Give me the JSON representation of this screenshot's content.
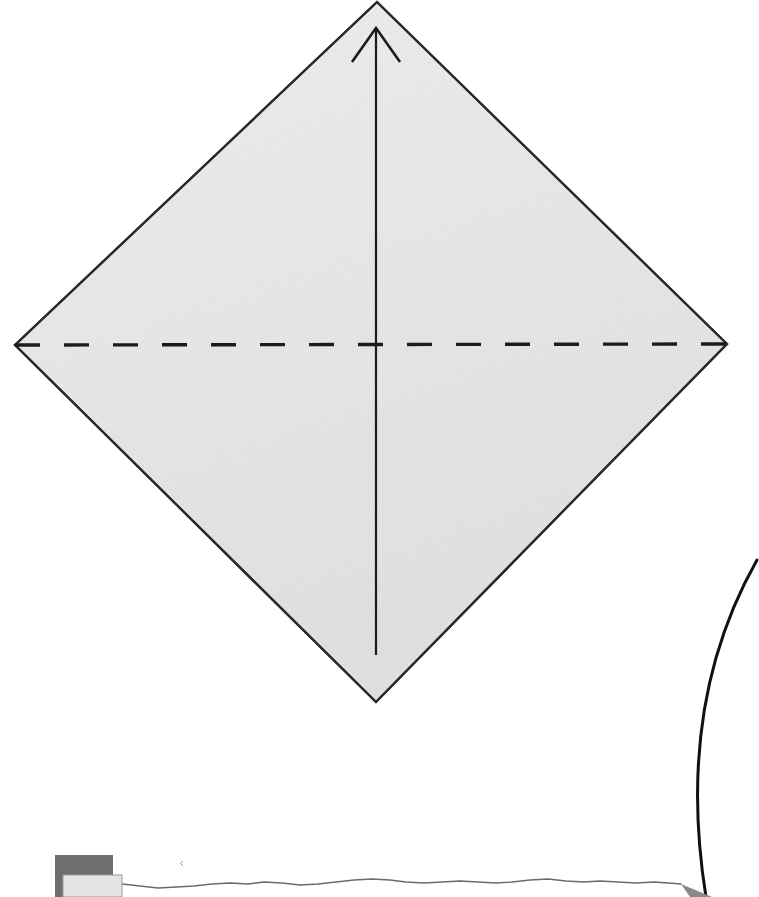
{
  "figure": {
    "kind": "origami-fold-diagram",
    "title": "Origami kite base valley-fold step",
    "background_color": "#ffffff",
    "canvas": {
      "width": 759,
      "height": 897
    }
  },
  "colors": {
    "paper_fill": "#e8e8e8",
    "paper_fill_light": "#efefef",
    "paper_outline": "#2a2a2a",
    "fold_line": "#1c1c1c",
    "arrow_line": "#1c1c1c",
    "curve_line": "#111111",
    "swatch_dark": "#6f6e6e",
    "swatch_light": "#e4e4e4",
    "swatch_outline": "#9a9a9a",
    "wavy_line": "#6a6a6a",
    "wedge_fill": "#8a8a8a"
  },
  "shapes": {
    "paper_sheet": {
      "name": "square sheet rotated 45 degrees (diamond)",
      "vertices": [
        {
          "label": "top",
          "x": 377,
          "y": 2
        },
        {
          "label": "right",
          "x": 727,
          "y": 344
        },
        {
          "label": "bottom",
          "x": 376,
          "y": 702
        },
        {
          "label": "left",
          "x": 15,
          "y": 345
        }
      ],
      "stroke_width": 2.2
    },
    "valley_fold_line": {
      "name": "horizontal dashed fold crease",
      "from": {
        "x": 15,
        "y": 345
      },
      "to": {
        "x": 727,
        "y": 344
      },
      "style": "dashed",
      "dash_length": 25,
      "gap_length": 24,
      "stroke_width": 3.4
    },
    "center_crease_line": {
      "name": "vertical center reference line",
      "from": {
        "x": 376,
        "y": 655
      },
      "to": {
        "x": 376,
        "y": 30
      },
      "style": "solid",
      "stroke_width": 2.2
    },
    "fold_direction_arrow": {
      "name": "upward open arrowhead",
      "tip": {
        "x": 376,
        "y": 28
      },
      "left_barb": {
        "x": 352,
        "y": 62
      },
      "right_barb": {
        "x": 400,
        "y": 62
      },
      "direction": "up",
      "stroke_width": 2.6
    },
    "background_curve": {
      "name": "large arc at lower right",
      "start": {
        "x": 757,
        "y": 560
      },
      "control": {
        "x": 690,
        "y": 740
      },
      "end": {
        "x": 706,
        "y": 897
      },
      "stroke_width": 3.0
    },
    "horizon_wavy_line": {
      "name": "hand-drawn wavy baseline",
      "start": {
        "x": 122,
        "y": 884
      },
      "end": {
        "x": 694,
        "y": 884
      },
      "stroke_width": 1.3
    },
    "wedge": {
      "name": "small gray wedge where baseline meets arc",
      "points": "681,884 710,897 694,897"
    },
    "swatch_dark": {
      "name": "dark gray rectangle",
      "x": 55,
      "y": 855,
      "width": 58,
      "height": 42
    },
    "swatch_light": {
      "name": "light gray rectangle overlapping dark one",
      "x": 63,
      "y": 875,
      "width": 59,
      "height": 22
    }
  },
  "annotations": {
    "fold_label": "",
    "step_number": "",
    "caption": ""
  }
}
